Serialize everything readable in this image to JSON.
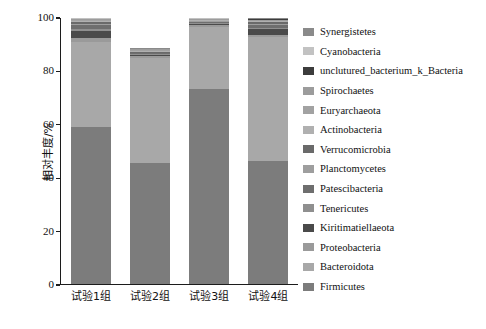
{
  "chart_data": {
    "type": "bar",
    "stacked": true,
    "title": "",
    "xlabel": "",
    "ylabel": "相对丰度/%",
    "ylim": [
      0,
      100
    ],
    "yticks": [
      0,
      20,
      40,
      60,
      80,
      100
    ],
    "ytick_labels": [
      "0",
      "20",
      "40",
      "60",
      "80",
      "100"
    ],
    "grid": false,
    "legend_position": "right",
    "categories": [
      "试验1组",
      "试验2组",
      "试验3组",
      "试验4组"
    ],
    "series": [
      {
        "name": "Firmicutes",
        "color": "#7c7c7c",
        "values": [
          58.9,
          45.4,
          73.2,
          46.2
        ]
      },
      {
        "name": "Bacteroidota",
        "color": "#a8a8a8",
        "values": [
          32.2,
          39.3,
          23.5,
          46.5
        ]
      },
      {
        "name": "Proteobacteria",
        "color": "#9a9a9a",
        "values": [
          1.2,
          0.5,
          0.6,
          0.8
        ]
      },
      {
        "name": "Kiritimatiellaeota",
        "color": "#4a4a4a",
        "values": [
          2.8,
          0.3,
          0.4,
          2.2
        ]
      },
      {
        "name": "Tenericutes",
        "color": "#8f8f8f",
        "values": [
          0.7,
          0.4,
          0.3,
          0.5
        ]
      },
      {
        "name": "Patescibacteria",
        "color": "#6e6e6e",
        "values": [
          1.5,
          0.4,
          0.5,
          1.3
        ]
      },
      {
        "name": "Planctomycetes",
        "color": "#9e9e9e",
        "values": [
          0.5,
          0.3,
          0.2,
          0.4
        ]
      },
      {
        "name": "Verrucomicrobia",
        "color": "#6a6a6a",
        "values": [
          0.6,
          0.3,
          0.3,
          0.5
        ]
      },
      {
        "name": "Actinobacteria",
        "color": "#b0b0b0",
        "values": [
          0.4,
          0.3,
          0.2,
          0.3
        ]
      },
      {
        "name": "Euryarchaeota",
        "color": "#a2a2a2",
        "values": [
          0.3,
          0.3,
          0.2,
          0.3
        ]
      },
      {
        "name": "Spirochaetes",
        "color": "#9c9c9c",
        "values": [
          0.4,
          0.3,
          0.2,
          0.3
        ]
      },
      {
        "name": "unclutured_bacterium_k_Bacteria",
        "color": "#3c3c3c",
        "values": [
          0.3,
          0.2,
          0.2,
          0.3
        ]
      },
      {
        "name": "Cyanobacteria",
        "color": "#c2c2c2",
        "values": [
          0.1,
          0.1,
          0.1,
          0.1
        ]
      },
      {
        "name": "Synergistetes",
        "color": "#8a8a8a",
        "values": [
          0.1,
          0.1,
          0.1,
          0.3
        ]
      }
    ],
    "legend_order": [
      "Synergistetes",
      "Cyanobacteria",
      "unclutured_bacterium_k_Bacteria",
      "Spirochaetes",
      "Euryarchaeota",
      "Actinobacteria",
      "Verrucomicrobia",
      "Planctomycetes",
      "Patescibacteria",
      "Tenericutes",
      "Kiritimatiellaeota",
      "Proteobacteria",
      "Bacteroidota",
      "Firmicutes"
    ]
  }
}
